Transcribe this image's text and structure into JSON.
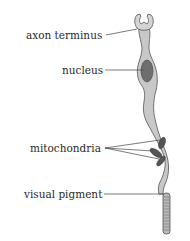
{
  "diagram": {
    "labels": {
      "axon_terminus": "axon terminus",
      "nucleus": "nucleus",
      "mitochondria": "mitochondria",
      "visual_pigment": "visual pigment"
    },
    "colors": {
      "cell_fill": "#c8c8c8",
      "cell_stroke": "#555555",
      "nucleus_fill": "#6e6e6e",
      "leader_line": "#444444",
      "text": "#2a2a2a"
    }
  }
}
